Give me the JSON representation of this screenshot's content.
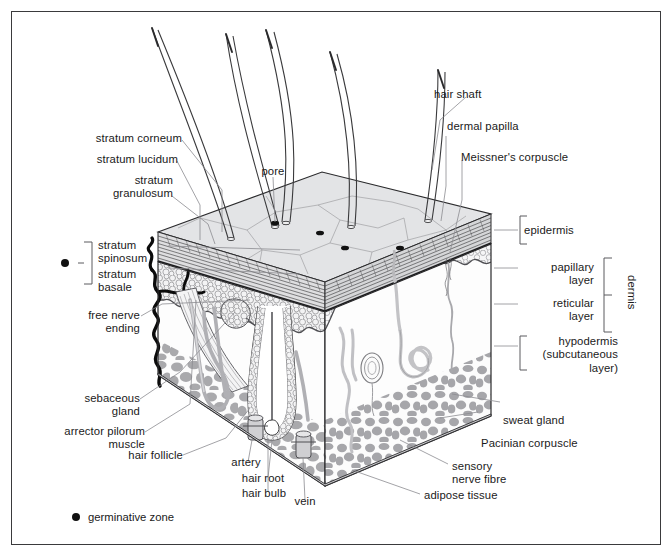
{
  "figure": {
    "border_color": "#3a3a3c",
    "background": "#ffffff"
  },
  "labels": {
    "left": [
      {
        "name": "stratum-corneum",
        "text": "stratum corneum"
      },
      {
        "name": "stratum-lucidum",
        "text": "stratum lucidum"
      },
      {
        "name": "stratum-granulosum",
        "text": "stratum\ngranulosum"
      },
      {
        "name": "stratum-spinosum",
        "text": "stratum\nspinosum"
      },
      {
        "name": "stratum-basale",
        "text": "stratum\nbasale"
      },
      {
        "name": "free-nerve-ending",
        "text": "free nerve\nending"
      },
      {
        "name": "sebaceous-gland",
        "text": "sebaceous\ngland"
      },
      {
        "name": "arrector-pilorum-muscle",
        "text": "arrector pilorum\nmuscle"
      }
    ],
    "bottom": [
      {
        "name": "hair-follicle",
        "text": "hair follicle"
      },
      {
        "name": "artery",
        "text": "artery"
      },
      {
        "name": "hair-root",
        "text": "hair root"
      },
      {
        "name": "hair-bulb",
        "text": "hair bulb"
      },
      {
        "name": "vein",
        "text": "vein"
      }
    ],
    "top": [
      {
        "name": "pore",
        "text": "pore"
      },
      {
        "name": "hair-shaft",
        "text": "hair shaft"
      },
      {
        "name": "dermal-papilla",
        "text": "dermal papilla"
      },
      {
        "name": "meissners-corpuscle",
        "text": "Meissner's corpuscle"
      }
    ],
    "right": [
      {
        "name": "epidermis",
        "text": "epidermis"
      },
      {
        "name": "papillary-layer",
        "text": "papillary\nlayer"
      },
      {
        "name": "reticular-layer",
        "text": "reticular\nlayer"
      },
      {
        "name": "hypodermis",
        "text": "hypodermis\n(subcutaneous\nlayer)"
      },
      {
        "name": "dermis",
        "text": "dermis"
      },
      {
        "name": "sweat-gland",
        "text": "sweat gland"
      },
      {
        "name": "pacinian-corpuscle",
        "text": "Pacinian corpuscle"
      },
      {
        "name": "sensory-nerve-fibre",
        "text": "sensory\nnerve fibre"
      },
      {
        "name": "adipose-tissue",
        "text": "adipose tissue"
      }
    ]
  },
  "legend": {
    "marker": "filled-circle",
    "marker_color": "#111111",
    "text": "germinative zone"
  },
  "colors": {
    "top_surface": "#e3e4e6",
    "epidermis_band": "#d8d9db",
    "papillary_cells": "#f2f2f3",
    "adipose_fill": "#a9a9ac",
    "hypodermis_bg": "#fbfbfb",
    "line": "#2a2a2c",
    "leader": "#8c8c90",
    "hair": "#3c3c3e",
    "vessel": "#b3b3b6",
    "nerve": "#0d0d0d"
  }
}
